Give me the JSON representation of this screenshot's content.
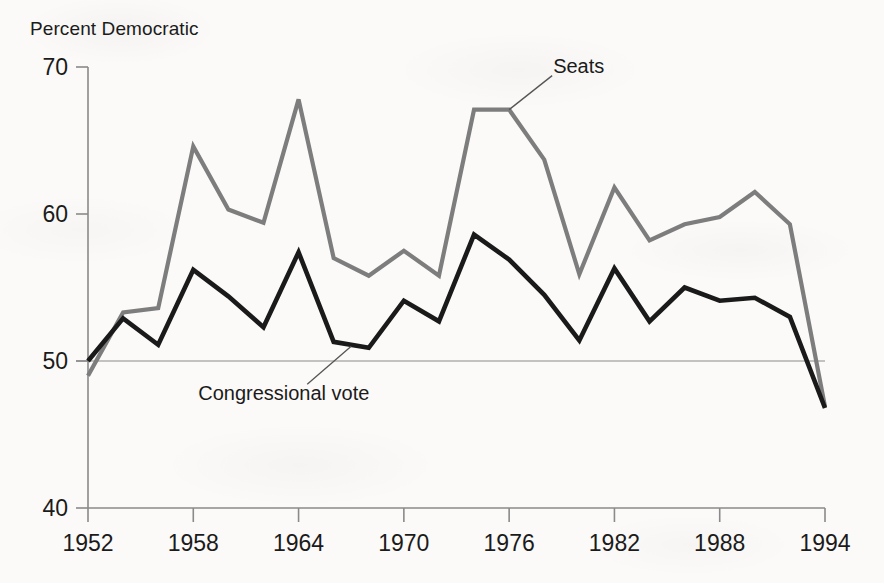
{
  "chart_data": {
    "type": "line",
    "title": "",
    "ylabel": "Percent Democratic",
    "xlabel": "",
    "xlim": [
      1952,
      1994
    ],
    "ylim": [
      40,
      70
    ],
    "yticks": [
      40,
      50,
      60,
      70
    ],
    "xticks": [
      1952,
      1958,
      1964,
      1970,
      1976,
      1982,
      1988,
      1994
    ],
    "grid": false,
    "reference_line": {
      "y": 50,
      "label": ""
    },
    "legend_position": "inline-annotations",
    "x": [
      1952,
      1954,
      1956,
      1958,
      1960,
      1962,
      1964,
      1966,
      1968,
      1970,
      1972,
      1974,
      1976,
      1978,
      1980,
      1982,
      1984,
      1986,
      1988,
      1990,
      1992,
      1994
    ],
    "series": [
      {
        "name": "Seats",
        "color": "#7d7d7d",
        "values": [
          49.0,
          53.3,
          53.6,
          64.6,
          60.3,
          59.4,
          67.8,
          57.0,
          55.8,
          57.5,
          55.8,
          67.1,
          67.1,
          63.7,
          55.9,
          61.8,
          58.2,
          59.3,
          59.8,
          61.5,
          59.3,
          46.9
        ]
      },
      {
        "name": "Congressional vote",
        "color": "#1a1a1a",
        "values": [
          50.0,
          52.9,
          51.1,
          56.2,
          54.4,
          52.3,
          57.4,
          51.3,
          50.9,
          54.1,
          52.7,
          58.6,
          56.9,
          54.5,
          51.4,
          56.3,
          52.7,
          55.0,
          54.1,
          54.3,
          53.0,
          46.8
        ]
      }
    ],
    "annotations": [
      {
        "text": "Seats",
        "target_year": 1976,
        "target_value": 67.1
      },
      {
        "text": "Congressional vote",
        "target_year": 1967,
        "target_value": 51.0
      }
    ]
  },
  "axis": {
    "y_title": "Percent Democratic",
    "yticks": [
      "70",
      "60",
      "50",
      "40"
    ],
    "xticks": [
      "1952",
      "1958",
      "1964",
      "1970",
      "1976",
      "1982",
      "1988",
      "1994"
    ]
  },
  "labels": {
    "seats": "Seats",
    "congressional_vote": "Congressional vote"
  },
  "colors": {
    "seats_line": "#7d7d7d",
    "vote_line": "#1a1a1a",
    "axis": "#8a8a8a",
    "background": "#fbfaf8",
    "text": "#1b1b1b"
  }
}
